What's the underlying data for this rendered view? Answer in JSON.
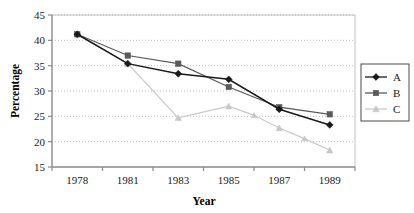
{
  "chart_data": {
    "type": "line",
    "title": "",
    "xlabel": "Year",
    "ylabel": "Percentage",
    "categories": [
      "1978",
      "1981",
      "1983",
      "1985",
      "1987",
      "1989"
    ],
    "ylim": [
      15,
      45
    ],
    "yticks": [
      15,
      20,
      25,
      30,
      35,
      40,
      45
    ],
    "ytick_labels": [
      "15",
      "20",
      "25",
      "30",
      "35",
      "40",
      "45"
    ],
    "grid": "horizontal-dotted",
    "legend_position": "right-outside",
    "series": [
      {
        "name": "A",
        "marker": "diamond",
        "color": "#1a1a1a",
        "values": [
          41.2,
          35.4,
          33.4,
          32.3,
          26.4,
          23.3
        ]
      },
      {
        "name": "B",
        "marker": "square",
        "color": "#5a5a5a",
        "values": [
          41.2,
          37.0,
          35.4,
          30.8,
          26.8,
          25.4
        ]
      },
      {
        "name": "C",
        "marker": "triangle",
        "color": "#c8c8c8",
        "values": [
          41.2,
          35.4,
          24.7,
          27.0,
          22.7,
          18.3
        ],
        "intermediate_points": [
          {
            "after_category": "1985",
            "value": 25.2
          },
          {
            "after_category": "1987",
            "value": 20.6
          }
        ]
      }
    ]
  },
  "legend": {
    "entries": [
      {
        "label": "A"
      },
      {
        "label": "B"
      },
      {
        "label": "C"
      }
    ]
  },
  "colors": {
    "series_a": "#1a1a1a",
    "series_b": "#5a5a5a",
    "series_c": "#c8c8c8",
    "axis": "#8a8a8a",
    "grid": "#b0b0b0",
    "background": "#ffffff"
  }
}
